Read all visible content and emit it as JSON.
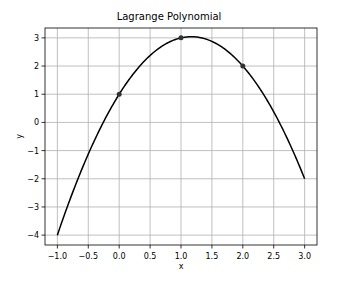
{
  "chart_data": {
    "type": "line",
    "title": "Lagrange Polynomial",
    "xlabel": "x",
    "ylabel": "y",
    "xlim": [
      -1.2,
      3.2
    ],
    "ylim": [
      -4.35,
      3.35
    ],
    "grid": true,
    "x_ticks": [
      "-1.0",
      "-0.5",
      "0.0",
      "0.5",
      "1.0",
      "1.5",
      "2.0",
      "2.5",
      "3.0"
    ],
    "y_ticks": [
      "-4",
      "-3",
      "-2",
      "-1",
      "0",
      "1",
      "2",
      "3"
    ],
    "series": [
      {
        "name": "Lagrange polynomial",
        "formula": "-1.5x^2 + 3.5x + 1",
        "x": [
          -1.0,
          -0.5,
          0.0,
          0.5,
          1.0,
          1.1667,
          1.5,
          2.0,
          2.5,
          3.0
        ],
        "y": [
          -4.0,
          -1.125,
          1.0,
          2.375,
          3.0,
          3.0417,
          2.875,
          2.0,
          0.375,
          -2.0
        ],
        "color": "#000000"
      },
      {
        "name": "Data points",
        "x": [
          0,
          1,
          2
        ],
        "y": [
          1,
          3,
          2
        ],
        "marker": "circle",
        "color": "#333333"
      }
    ]
  }
}
